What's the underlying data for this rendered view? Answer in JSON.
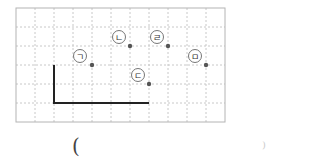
{
  "grid": {
    "left": 16,
    "top": 8,
    "cell": 19,
    "cols": 11,
    "rows": 6,
    "grid_color": "#c8c8c8",
    "border_color": "#b4b4b4"
  },
  "polyline": {
    "points": [
      [
        54,
        65
      ],
      [
        54,
        103
      ],
      [
        149,
        103
      ]
    ],
    "color": "#222222"
  },
  "points": [
    {
      "label": "ㄱ",
      "x": 92,
      "y": 65,
      "lx": 80,
      "ly": 56
    },
    {
      "label": "ㄴ",
      "x": 130,
      "y": 46,
      "lx": 119,
      "ly": 37
    },
    {
      "label": "ㄷ",
      "x": 149,
      "y": 84,
      "lx": 138,
      "ly": 75
    },
    {
      "label": "ㄹ",
      "x": 168,
      "y": 46,
      "lx": 157,
      "ly": 37
    },
    {
      "label": "ㅁ",
      "x": 206,
      "y": 65,
      "lx": 195,
      "ly": 56
    }
  ],
  "answer": {
    "open_paren": "(",
    "close_paren": ")"
  }
}
